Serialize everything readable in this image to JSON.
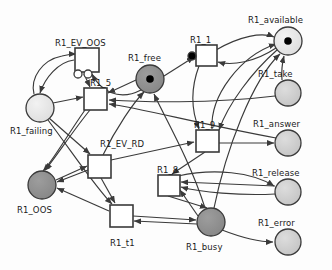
{
  "diagram": {
    "type": "petri-net",
    "colors": {
      "stroke": "#3a3a3a",
      "place_light": "#e8e8e8",
      "place_mid": "#c9c9c9",
      "place_dark": "#8f8f8f",
      "transition_fill": "#ffffff",
      "token": "#000000",
      "label": "#1a1a1a"
    },
    "places": [
      {
        "id": "R1_available",
        "label": "R1_available",
        "cx": 288,
        "cy": 41,
        "r": 14,
        "fill": "place_light",
        "tokens": 1,
        "label_x": 248,
        "label_y": 16
      },
      {
        "id": "R1_free",
        "label": "R1_free",
        "cx": 150,
        "cy": 79,
        "r": 14,
        "fill": "place_dark",
        "tokens": 1,
        "label_x": 128,
        "label_y": 54
      },
      {
        "id": "R1_take",
        "label": "R1_take",
        "cx": 288,
        "cy": 93,
        "r": 13,
        "fill": "place_mid",
        "tokens": 0,
        "label_x": 258,
        "label_y": 70
      },
      {
        "id": "R1_failing",
        "label": "R1_failing",
        "cx": 40,
        "cy": 108,
        "r": 14,
        "fill": "place_light",
        "tokens": 0,
        "label_x": 10,
        "label_y": 127
      },
      {
        "id": "R1_answer",
        "label": "R1_answer",
        "cx": 288,
        "cy": 143,
        "r": 13,
        "fill": "place_mid",
        "tokens": 0,
        "label_x": 253,
        "label_y": 120
      },
      {
        "id": "R1_OOS",
        "label": "R1_OOS",
        "cx": 42,
        "cy": 185,
        "r": 14,
        "fill": "place_dark",
        "tokens": 0,
        "label_x": 17,
        "label_y": 206
      },
      {
        "id": "R1_release",
        "label": "R1_release",
        "cx": 288,
        "cy": 192,
        "r": 13,
        "fill": "place_mid",
        "tokens": 0,
        "label_x": 252,
        "label_y": 169
      },
      {
        "id": "R1_busy",
        "label": "R1_busy",
        "cx": 211,
        "cy": 222,
        "r": 14,
        "fill": "place_dark",
        "tokens": 0,
        "label_x": 186,
        "label_y": 243
      },
      {
        "id": "R1_error",
        "label": "R1_error",
        "cx": 288,
        "cy": 242,
        "r": 13,
        "fill": "place_mid",
        "tokens": 0,
        "label_x": 258,
        "label_y": 219
      }
    ],
    "transitions": [
      {
        "id": "R1_EV_OOS",
        "label": "R1_EV_OOS",
        "x": 75,
        "y": 48,
        "w": 24,
        "h": 24,
        "label_x": 55,
        "label_y": 39,
        "inhibitors": [
          {
            "cx": 78,
            "cy": 74,
            "r": 4
          },
          {
            "cx": 88,
            "cy": 74,
            "r": 4
          }
        ]
      },
      {
        "id": "R1_1",
        "label": "R1_1",
        "x": 196,
        "y": 45,
        "w": 21,
        "h": 21,
        "label_x": 190,
        "label_y": 36,
        "inhibitors": [
          {
            "cx": 192,
            "cy": 56,
            "r": 4,
            "filled": true
          }
        ]
      },
      {
        "id": "R1_5",
        "label": "R1_5",
        "x": 84,
        "y": 88,
        "w": 23,
        "h": 22,
        "label_x": 90,
        "label_y": 79,
        "inhibitors": []
      },
      {
        "id": "R1_9",
        "label": "R1_9",
        "x": 196,
        "y": 130,
        "w": 23,
        "h": 22,
        "label_x": 194,
        "label_y": 121,
        "inhibitors": []
      },
      {
        "id": "R1_EV_RD",
        "label": "R1_EV_RD",
        "x": 88,
        "y": 155,
        "w": 23,
        "h": 23,
        "label_x": 100,
        "label_y": 140,
        "inhibitors": []
      },
      {
        "id": "R1_8",
        "label": "R1_8",
        "x": 158,
        "y": 175,
        "w": 22,
        "h": 21,
        "label_x": 157,
        "label_y": 166,
        "inhibitors": []
      },
      {
        "id": "R1_t1",
        "label": "R1_t1",
        "x": 110,
        "y": 205,
        "w": 23,
        "h": 22,
        "label_x": 110,
        "label_y": 239,
        "inhibitors": []
      }
    ],
    "arcs": [
      {
        "from": "R1_EV_OOS",
        "to": "R1_failing",
        "path": "M 74,60 C 58,62 45,78 40,93"
      },
      {
        "from": "R1_failing",
        "to": "R1_EV_OOS",
        "path": "M 34,94 C 30,78 42,60 62,56 C 70,54 74,54 76,54"
      },
      {
        "from": "R1_failing",
        "to": "R1_5",
        "path": "M 53,103 L 83,97"
      },
      {
        "from": "R1_EV_OOS",
        "to": "R1_5",
        "path": "M 84,74 L 90,87"
      },
      {
        "from": "R1_free",
        "to": "R1_5",
        "path": "M 136,80 L 108,93"
      },
      {
        "from": "R1_free",
        "to": "R1_1",
        "path": "M 164,76 L 194,57"
      },
      {
        "from": "R1_1",
        "to": "R1_available",
        "path": "M 216,50 C 240,36 262,32 274,37"
      },
      {
        "from": "R1_available",
        "to": "R1_1",
        "path": "M 276,48 C 255,62 232,66 218,62"
      },
      {
        "from": "R1_available",
        "to": "R1_9",
        "path": "M 277,50 C 252,72 228,104 219,130"
      },
      {
        "from": "R1_9",
        "to": "R1_available",
        "path": "M 212,129 C 210,96 240,56 276,44"
      },
      {
        "from": "R1_take",
        "to": "R1_available",
        "path": "M 282,80 C 281,68 283,60 284,56"
      },
      {
        "from": "R1_9",
        "to": "R1_answer",
        "path": "M 219,143 L 274,143"
      },
      {
        "from": "R1_9",
        "to": "R1_8",
        "path": "M 205,152 L 172,174"
      },
      {
        "from": "R1_8",
        "to": "R1_busy",
        "path": "M 168,196 L 207,208"
      },
      {
        "from": "R1_busy",
        "to": "R1_8",
        "path": "M 198,216 L 180,190"
      },
      {
        "from": "R1_busy",
        "to": "R1_error",
        "path": "M 222,230 C 248,240 264,242 273,242"
      },
      {
        "from": "R1_release",
        "to": "R1_8",
        "path": "M 275,186 L 181,182"
      },
      {
        "from": "R1_release",
        "to": "R1_8",
        "path": "M 275,194 C 240,196 200,192 181,187"
      },
      {
        "from": "R1_busy",
        "to": "R1_free",
        "path": "M 205,208 C 190,160 164,116 154,94"
      },
      {
        "from": "R1_t1",
        "to": "R1_OOS",
        "path": "M 109,211 L 57,188"
      },
      {
        "from": "R1_EV_RD",
        "to": "R1_t1",
        "path": "M 101,178 L 115,203"
      },
      {
        "from": "R1_EV_RD",
        "to": "R1_OOS",
        "path": "M 88,170 L 57,182"
      },
      {
        "from": "R1_OOS",
        "to": "R1_EV_RD",
        "path": "M 56,180 L 87,166"
      },
      {
        "from": "R1_5",
        "to": "R1_OOS",
        "path": "M 90,110 C 72,132 54,160 45,170"
      },
      {
        "from": "R1_5",
        "to": "R1_OOS",
        "path": "M 85,110 C 68,134 52,162 43,171"
      },
      {
        "from": "R1_EV_RD",
        "to": "R1_free",
        "path": "M 103,155 C 116,128 134,102 144,92"
      },
      {
        "from": "R1_t1",
        "to": "R1_busy",
        "path": "M 133,216 L 196,220"
      },
      {
        "from": "R1_busy",
        "to": "R1_t1",
        "path": "M 197,224 L 134,221"
      },
      {
        "from": "R1_1",
        "to": "R1_9",
        "path": "M 199,66 C 190,90 192,112 199,129"
      },
      {
        "from": "R1_EV_RD",
        "to": "R1_9",
        "path": "M 111,160 L 194,142"
      },
      {
        "from": "R1_8",
        "to": "R1_release",
        "path": "M 178,176 C 214,168 252,172 274,186"
      },
      {
        "from": "R1_take",
        "to": "R1_5",
        "path": "M 275,96 C 210,104 140,102 109,100"
      },
      {
        "from": "R1_answer",
        "to": "R1_5",
        "path": "M 276,138 C 200,124 140,108 109,104"
      },
      {
        "from": "R1_free",
        "to": "R1_EV_OOS",
        "path": "M 141,90 C 118,102 100,90 92,74"
      },
      {
        "from": "R1_busy",
        "to": "R1_available",
        "path": "M 214,208 C 226,150 252,80 280,54"
      },
      {
        "from": "R1_failing",
        "to": "R1_t1",
        "path": "M 48,120 C 72,152 96,188 112,204"
      },
      {
        "from": "R1_failing",
        "to": "R1_EV_RD",
        "path": "M 49,118 L 90,154"
      }
    ]
  }
}
